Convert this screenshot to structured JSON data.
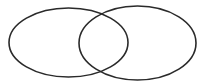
{
  "diagram": {
    "type": "venn",
    "background": "#ffffff",
    "stroke_color": "#2a2a2a",
    "stroke_width": 1.6,
    "sets": [
      {
        "name": "left-set",
        "label": "",
        "cx": 68.5,
        "cy": 42.5,
        "rx": 59.5,
        "ry": 34.5
      },
      {
        "name": "right-set",
        "label": "",
        "cx": 137.5,
        "cy": 43,
        "rx": 58.5,
        "ry": 37
      }
    ]
  }
}
